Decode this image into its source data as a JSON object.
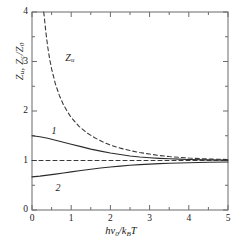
{
  "chart_data": {
    "type": "line",
    "title": "",
    "xlabel": "hv0/kBT",
    "ylabel": "Zu, Zc/Z0",
    "xlim": [
      0,
      5
    ],
    "ylim": [
      0,
      4
    ],
    "xticks": [
      "0",
      "1",
      "2",
      "3",
      "4",
      "5"
    ],
    "yticks": [
      "0",
      "1",
      "2",
      "3",
      "4"
    ],
    "xtick_values": [
      0,
      1,
      2,
      3,
      4,
      5
    ],
    "ytick_values": [
      0,
      1,
      2,
      3,
      4
    ],
    "minor_ticks": true,
    "grid": false,
    "legend": "none",
    "annotations": [
      {
        "text": "Zu",
        "x": 0.85,
        "y": 3.05
      },
      {
        "text": "1",
        "x": 0.5,
        "y": 1.58
      },
      {
        "text": "2",
        "x": 0.6,
        "y": 0.42
      }
    ],
    "series": [
      {
        "name": "Zu",
        "style": "dashed",
        "color": "#3a3a3a",
        "x": [
          0.3,
          0.35,
          0.4,
          0.45,
          0.5,
          0.6,
          0.7,
          0.8,
          0.9,
          1.0,
          1.2,
          1.4,
          1.6,
          1.8,
          2.0,
          2.25,
          2.5,
          2.75,
          3.0,
          3.25,
          3.5,
          4.0,
          4.5,
          5.0
        ],
        "y": [
          4.0,
          3.62,
          3.3,
          3.05,
          2.85,
          2.54,
          2.31,
          2.13,
          1.99,
          1.87,
          1.69,
          1.56,
          1.46,
          1.38,
          1.31,
          1.25,
          1.2,
          1.16,
          1.13,
          1.1,
          1.08,
          1.05,
          1.03,
          1.02
        ]
      },
      {
        "name": "1",
        "style": "solid",
        "color": "#2b2b2b",
        "x": [
          0.0,
          0.2,
          0.4,
          0.6,
          0.8,
          1.0,
          1.25,
          1.5,
          1.75,
          2.0,
          2.25,
          2.5,
          2.75,
          3.0,
          3.25,
          3.5,
          3.75,
          4.0,
          4.5,
          5.0
        ],
        "y": [
          1.5,
          1.48,
          1.45,
          1.41,
          1.37,
          1.33,
          1.28,
          1.23,
          1.19,
          1.15,
          1.12,
          1.09,
          1.07,
          1.055,
          1.043,
          1.034,
          1.027,
          1.021,
          1.013,
          1.008
        ]
      },
      {
        "name": "2",
        "style": "solid",
        "color": "#2b2b2b",
        "x": [
          0.0,
          0.2,
          0.4,
          0.6,
          0.8,
          1.0,
          1.25,
          1.5,
          1.75,
          2.0,
          2.25,
          2.5,
          2.75,
          3.0,
          3.25,
          3.5,
          3.75,
          4.0,
          4.5,
          5.0
        ],
        "y": [
          0.67,
          0.685,
          0.705,
          0.725,
          0.748,
          0.77,
          0.798,
          0.824,
          0.848,
          0.869,
          0.887,
          0.903,
          0.916,
          0.927,
          0.936,
          0.944,
          0.95,
          0.956,
          0.964,
          0.97
        ]
      },
      {
        "name": "unity-reference",
        "style": "dashed",
        "color": "#3a3a3a",
        "x": [
          0.0,
          5.0
        ],
        "y": [
          1.0,
          1.0
        ]
      }
    ]
  },
  "axis": {
    "x_label_parts": {
      "h": "h",
      "nu": "ν",
      "sub0": "0",
      "slash": "/",
      "k": "k",
      "subB": "B",
      "T": "T"
    },
    "y_label_parts": {
      "Z1": "Z",
      "sub_u": "u",
      "comma": ", ",
      "Z2": "Z",
      "sub_c": "c",
      "slash": "/",
      "Z3": "Z",
      "sub_0": "0"
    }
  }
}
